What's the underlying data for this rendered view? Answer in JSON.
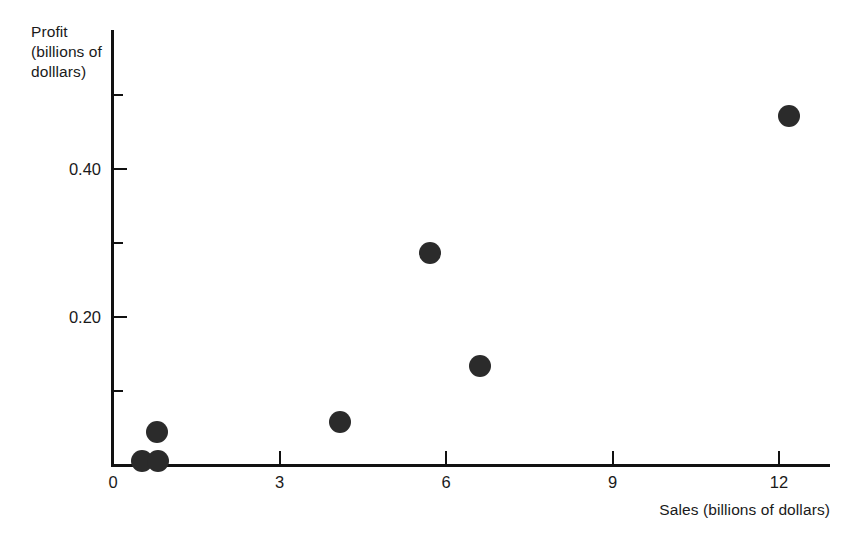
{
  "chart_data": {
    "type": "scatter",
    "title": "",
    "xlabel": "Sales (billions of dollars)",
    "ylabel": "Profit\n(billions of\ndolllars)",
    "xlim": [
      0,
      12.93
    ],
    "ylim": [
      0,
      0.5878
    ],
    "grid": false,
    "legend": null,
    "x_ticks": [
      {
        "value": 0,
        "label": "0"
      },
      {
        "value": 3,
        "label": "3"
      },
      {
        "value": 6,
        "label": "6"
      },
      {
        "value": 9,
        "label": "9"
      },
      {
        "value": 12,
        "label": "12"
      }
    ],
    "y_ticks": [
      {
        "value": 0.5,
        "label": "",
        "minor": true
      },
      {
        "value": 0.4,
        "label": "0.40",
        "minor": false
      },
      {
        "value": 0.3,
        "label": "",
        "minor": true
      },
      {
        "value": 0.2,
        "label": "0.20",
        "minor": false
      },
      {
        "value": 0.1,
        "label": "",
        "minor": true
      }
    ],
    "points": [
      {
        "x": 0.52,
        "y": 0.005
      },
      {
        "x": 0.81,
        "y": 0.005
      },
      {
        "x": 0.79,
        "y": 0.045
      },
      {
        "x": 4.09,
        "y": 0.058
      },
      {
        "x": 5.71,
        "y": 0.286
      },
      {
        "x": 6.61,
        "y": 0.134
      },
      {
        "x": 12.18,
        "y": 0.472
      }
    ],
    "marker": {
      "shape": "circle",
      "color": "#2b2b2b",
      "size_px": 22
    },
    "axis_color": "#111111",
    "background_color": "#ffffff"
  }
}
